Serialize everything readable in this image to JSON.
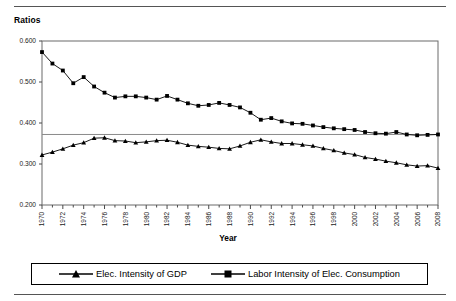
{
  "figure": {
    "y_axis_title": "Ratios",
    "x_axis_title": "Year"
  },
  "legend": {
    "entries": [
      {
        "label": "Elec. Intensity of GDP",
        "marker": "triangle-marker",
        "color": "#000000"
      },
      {
        "label": "Labor Intensity of Elec. Consumption",
        "marker": "square-marker",
        "color": "#000000"
      }
    ]
  },
  "axes": {
    "y_ticks": [
      "0.200",
      "0.300",
      "0.400",
      "0.500",
      "0.600"
    ],
    "x_ticks": [
      "1970",
      "1972",
      "1974",
      "1976",
      "1978",
      "1980",
      "1982",
      "1984",
      "1986",
      "1988",
      "1990",
      "1992",
      "1994",
      "1996",
      "1998",
      "2000",
      "2002",
      "2004",
      "2006",
      "2008"
    ]
  },
  "chart_data": {
    "type": "line",
    "title": "",
    "subtitle": "",
    "xlabel": "Year",
    "ylabel": "Ratios",
    "xlim": [
      1970,
      2008
    ],
    "ylim": [
      0.2,
      0.6
    ],
    "ytick_values": [
      0.2,
      0.3,
      0.4,
      0.5,
      0.6
    ],
    "xtick_values": [
      1970,
      1972,
      1974,
      1976,
      1978,
      1980,
      1982,
      1984,
      1986,
      1988,
      1990,
      1992,
      1994,
      1996,
      1998,
      2000,
      2002,
      2004,
      2006,
      2008
    ],
    "grid": false,
    "reference_line_y": 0.372,
    "legend_position": "bottom",
    "x": [
      1970,
      1971,
      1972,
      1973,
      1974,
      1975,
      1976,
      1977,
      1978,
      1979,
      1980,
      1981,
      1982,
      1983,
      1984,
      1985,
      1986,
      1987,
      1988,
      1989,
      1990,
      1991,
      1992,
      1993,
      1994,
      1995,
      1996,
      1997,
      1998,
      1999,
      2000,
      2001,
      2002,
      2003,
      2004,
      2005,
      2006,
      2007,
      2008
    ],
    "series": [
      {
        "name": "Labor Intensity of Elec. Consumption",
        "marker": "square",
        "color": "#000000",
        "values": [
          0.573,
          0.545,
          0.528,
          0.497,
          0.512,
          0.489,
          0.474,
          0.462,
          0.465,
          0.465,
          0.462,
          0.457,
          0.466,
          0.457,
          0.448,
          0.442,
          0.444,
          0.449,
          0.444,
          0.438,
          0.425,
          0.408,
          0.412,
          0.404,
          0.399,
          0.398,
          0.394,
          0.39,
          0.387,
          0.385,
          0.383,
          0.378,
          0.375,
          0.374,
          0.378,
          0.372,
          0.37,
          0.371,
          0.372
        ]
      },
      {
        "name": "Elec. Intensity of GDP",
        "marker": "triangle",
        "color": "#000000",
        "values": [
          0.322,
          0.329,
          0.337,
          0.346,
          0.352,
          0.363,
          0.364,
          0.357,
          0.356,
          0.352,
          0.354,
          0.357,
          0.358,
          0.353,
          0.346,
          0.343,
          0.341,
          0.338,
          0.337,
          0.344,
          0.353,
          0.359,
          0.354,
          0.35,
          0.35,
          0.347,
          0.344,
          0.338,
          0.333,
          0.327,
          0.323,
          0.316,
          0.312,
          0.307,
          0.303,
          0.298,
          0.295,
          0.296,
          0.29
        ]
      }
    ]
  }
}
